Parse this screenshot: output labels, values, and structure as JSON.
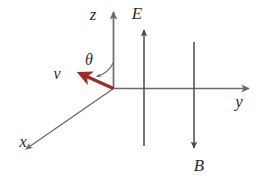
{
  "figure": {
    "background_color": "#ffffff",
    "axis_color": "#6b6b6b",
    "field_color": "#4a4a4a",
    "vector_color": "#9e2b2b",
    "label_color": "#2e2e2e"
  },
  "axes": {
    "z": {
      "label": "z",
      "direction": "up",
      "label_x": 93,
      "label_y": 20
    },
    "y": {
      "label": "y",
      "direction": "right",
      "label_x": 239,
      "label_y": 107
    },
    "x": {
      "label": "x",
      "direction": "down-left",
      "label_x": 23,
      "label_y": 147
    }
  },
  "vectors": [
    {
      "name": "velocity",
      "label": "v",
      "color": "#9e2b2b",
      "label_x": 57,
      "label_y": 79,
      "direction": "up-left"
    },
    {
      "name": "electric-field",
      "label": "E",
      "color": "#4a4a4a",
      "label_x": 137,
      "label_y": 19,
      "direction": "up"
    },
    {
      "name": "magnetic-field",
      "label": "B",
      "color": "#4a4a4a",
      "label_x": 199,
      "label_y": 171,
      "direction": "down"
    }
  ],
  "angle": {
    "label": "θ",
    "between": "velocity and z-axis",
    "label_x": 89,
    "label_y": 65
  }
}
